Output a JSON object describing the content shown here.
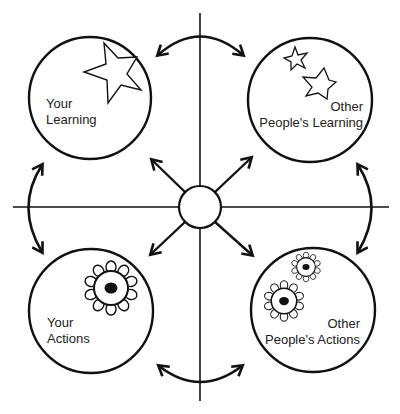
{
  "diagram": {
    "colors": {
      "stroke": "#111111",
      "text": "#222222",
      "background": "#ffffff"
    },
    "center_node": {
      "shape": "circle"
    },
    "quadrants": [
      {
        "id": "your-learning",
        "line1": "Your",
        "line2": "Learning",
        "icon": "star-icon",
        "icon_count": 1
      },
      {
        "id": "other-learning",
        "line1": "Other",
        "line2": "People's Learning",
        "icon": "star-icon",
        "icon_count": 2
      },
      {
        "id": "your-actions",
        "line1": "Your",
        "line2": "Actions",
        "icon": "flower-icon",
        "icon_count": 1
      },
      {
        "id": "other-actions",
        "line1": "Other",
        "line2": "People's Actions",
        "icon": "flower-icon",
        "icon_count": 2
      }
    ],
    "connectors": [
      {
        "id": "top",
        "type": "curved-double-arrow",
        "between": [
          "your-learning",
          "other-learning"
        ]
      },
      {
        "id": "bottom",
        "type": "curved-double-arrow",
        "between": [
          "your-actions",
          "other-actions"
        ]
      },
      {
        "id": "left",
        "type": "curved-double-arrow",
        "between": [
          "your-learning",
          "your-actions"
        ]
      },
      {
        "id": "right",
        "type": "curved-double-arrow",
        "between": [
          "other-learning",
          "other-actions"
        ]
      },
      {
        "id": "center-tl",
        "type": "arrow",
        "from": "center",
        "to": "your-learning"
      },
      {
        "id": "center-tr",
        "type": "arrow",
        "from": "center",
        "to": "other-learning"
      },
      {
        "id": "center-bl",
        "type": "arrow",
        "from": "center",
        "to": "your-actions"
      },
      {
        "id": "center-br",
        "type": "arrow",
        "from": "center",
        "to": "other-actions"
      }
    ]
  }
}
